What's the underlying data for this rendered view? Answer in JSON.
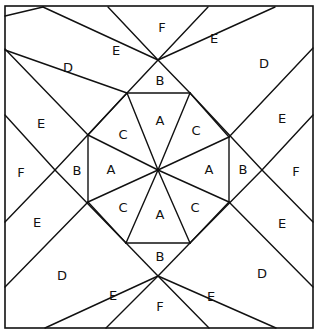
{
  "diagram": {
    "colors": {
      "line": "#111111",
      "background": "#ffffff"
    },
    "frame": {
      "x": 5,
      "y": 6,
      "width": 308,
      "height": 322
    },
    "lines": [
      [
        43,
        7,
        158,
        60
      ],
      [
        108,
        7,
        158,
        60
      ],
      [
        158,
        60,
        208,
        7
      ],
      [
        158,
        60,
        275,
        7
      ],
      [
        5,
        50,
        127,
        93
      ],
      [
        5,
        16,
        43,
        7
      ],
      [
        127,
        93,
        190,
        93
      ],
      [
        127,
        93,
        158,
        60
      ],
      [
        190,
        93,
        158,
        60
      ],
      [
        190,
        93,
        262,
        170
      ],
      [
        127,
        93,
        55,
        170
      ],
      [
        5,
        49,
        88,
        135
      ],
      [
        5,
        115,
        55,
        170
      ],
      [
        5,
        222,
        55,
        170
      ],
      [
        5,
        287,
        88,
        202
      ],
      [
        88,
        135,
        127,
        93
      ],
      [
        88,
        135,
        88,
        202
      ],
      [
        88,
        202,
        126,
        243
      ],
      [
        313,
        48,
        229,
        137
      ],
      [
        313,
        115,
        262,
        170
      ],
      [
        313,
        222,
        262,
        170
      ],
      [
        313,
        287,
        229,
        202
      ],
      [
        229,
        137,
        190,
        93
      ],
      [
        229,
        137,
        229,
        202
      ],
      [
        229,
        202,
        190,
        243
      ],
      [
        126,
        243,
        190,
        243
      ],
      [
        126,
        243,
        158,
        276
      ],
      [
        190,
        243,
        158,
        276
      ],
      [
        126,
        243,
        55,
        170
      ],
      [
        190,
        243,
        262,
        170
      ],
      [
        45,
        328,
        158,
        276
      ],
      [
        106,
        328,
        158,
        276
      ],
      [
        158,
        276,
        209,
        328
      ],
      [
        158,
        276,
        276,
        328
      ],
      [
        158,
        170,
        127,
        93
      ],
      [
        158,
        170,
        190,
        93
      ],
      [
        158,
        170,
        88,
        135
      ],
      [
        158,
        170,
        88,
        202
      ],
      [
        158,
        170,
        229,
        137
      ],
      [
        158,
        170,
        229,
        202
      ],
      [
        158,
        170,
        126,
        243
      ],
      [
        158,
        170,
        190,
        243
      ]
    ],
    "labels": [
      {
        "text": "F",
        "x": 162,
        "y": 27
      },
      {
        "text": "E",
        "x": 116,
        "y": 50
      },
      {
        "text": "E",
        "x": 214,
        "y": 38
      },
      {
        "text": "D",
        "x": 68,
        "y": 67
      },
      {
        "text": "D",
        "x": 264,
        "y": 63
      },
      {
        "text": "B",
        "x": 160,
        "y": 80
      },
      {
        "text": "A",
        "x": 160,
        "y": 120
      },
      {
        "text": "C",
        "x": 123,
        "y": 134
      },
      {
        "text": "C",
        "x": 196,
        "y": 130
      },
      {
        "text": "E",
        "x": 41,
        "y": 123
      },
      {
        "text": "E",
        "x": 282,
        "y": 118
      },
      {
        "text": "F",
        "x": 21,
        "y": 172
      },
      {
        "text": "B",
        "x": 77,
        "y": 170
      },
      {
        "text": "A",
        "x": 111,
        "y": 169
      },
      {
        "text": "A",
        "x": 209,
        "y": 169
      },
      {
        "text": "B",
        "x": 243,
        "y": 169
      },
      {
        "text": "F",
        "x": 296,
        "y": 171
      },
      {
        "text": "C",
        "x": 123,
        "y": 207
      },
      {
        "text": "A",
        "x": 160,
        "y": 214
      },
      {
        "text": "C",
        "x": 195,
        "y": 207
      },
      {
        "text": "E",
        "x": 37,
        "y": 222
      },
      {
        "text": "E",
        "x": 282,
        "y": 223
      },
      {
        "text": "B",
        "x": 160,
        "y": 256
      },
      {
        "text": "D",
        "x": 62,
        "y": 275
      },
      {
        "text": "D",
        "x": 262,
        "y": 273
      },
      {
        "text": "E",
        "x": 113,
        "y": 295
      },
      {
        "text": "E",
        "x": 211,
        "y": 296
      },
      {
        "text": "F",
        "x": 160,
        "y": 306
      }
    ]
  }
}
